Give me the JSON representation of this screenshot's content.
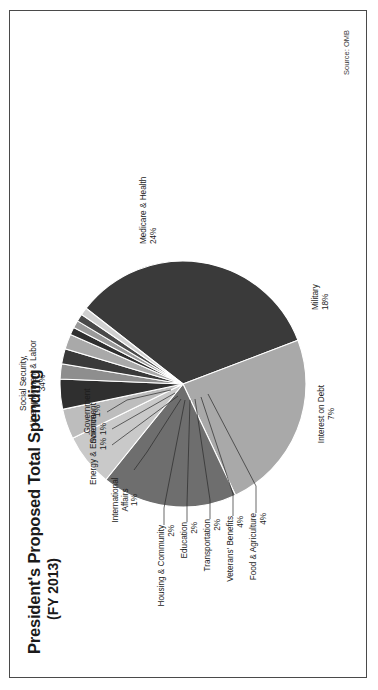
{
  "figure": {
    "title": "President's Proposed Total Spending",
    "subtitle": "(FY 2013)",
    "source": "Source: OMB",
    "frame_color": "#4a4a4a",
    "background": "#ffffff"
  },
  "chart_data": {
    "type": "pie",
    "title": "President's Proposed Total Spending (FY 2013)",
    "xlabel": "",
    "ylabel": "",
    "legend_position": "none",
    "grid": false,
    "units": "percent of total spending",
    "source": "Source: OMB",
    "labels": [
      "Social Security, Unemployment & Labor",
      "Medicare & Health",
      "Military",
      "Interest on Debt",
      "Food & Agriculture",
      "Veterans' Benefits",
      "Transportation",
      "Education",
      "Housing & Community",
      "International Affairs",
      "Energy & Environment",
      "Science",
      "Government"
    ],
    "values": [
      34,
      24,
      18,
      7,
      4,
      4,
      2,
      2,
      2,
      1,
      1,
      1,
      1
    ],
    "value_text": [
      "34%",
      "24%",
      "18%",
      "7%",
      "4%",
      "4%",
      "2%",
      "2%",
      "2%",
      "1%",
      "1%",
      "1%",
      "1%"
    ],
    "colors": [
      "#3a3a3a",
      "#a9a9a9",
      "#6e6e6e",
      "#c9c9c9",
      "#bdbdbd",
      "#2f2f2f",
      "#8e8e8e",
      "#3a3a3a",
      "#a9a9a9",
      "#2f2f2f",
      "#9a9a9a",
      "#4a4a4a",
      "#d0d0d0"
    ]
  },
  "slices": [
    {
      "name": "social-security",
      "label_line1": "Social Security,",
      "label_line2": "Unemployment & Labor",
      "pct": "34%"
    },
    {
      "name": "medicare-health",
      "label_line1": "Medicare & Health",
      "label_line2": "",
      "pct": "24%"
    },
    {
      "name": "military",
      "label_line1": "Military",
      "label_line2": "",
      "pct": "18%"
    },
    {
      "name": "interest-on-debt",
      "label_line1": "Interest on Debt",
      "label_line2": "",
      "pct": "7%"
    },
    {
      "name": "food-agriculture",
      "label_line1": "Food & Agriculture",
      "label_line2": "",
      "pct": "4%"
    },
    {
      "name": "veterans-benefits",
      "label_line1": "Veterans' Benefits",
      "label_line2": "",
      "pct": "4%"
    },
    {
      "name": "transportation",
      "label_line1": "Transportation",
      "label_line2": "",
      "pct": "2%"
    },
    {
      "name": "education",
      "label_line1": "Education",
      "label_line2": "",
      "pct": "2%"
    },
    {
      "name": "housing-community",
      "label_line1": "Housing & Community",
      "label_line2": "",
      "pct": "2%"
    },
    {
      "name": "international-affairs",
      "label_line1": "International",
      "label_line2": "Affairs",
      "pct": "1%"
    },
    {
      "name": "energy-environment",
      "label_line1": "Energy & Environment",
      "label_line2": "",
      "pct": "1%"
    },
    {
      "name": "science",
      "label_line1": "Science",
      "label_line2": "",
      "pct": "1%"
    },
    {
      "name": "government",
      "label_line1": "Government",
      "label_line2": "",
      "pct": "1%"
    }
  ]
}
